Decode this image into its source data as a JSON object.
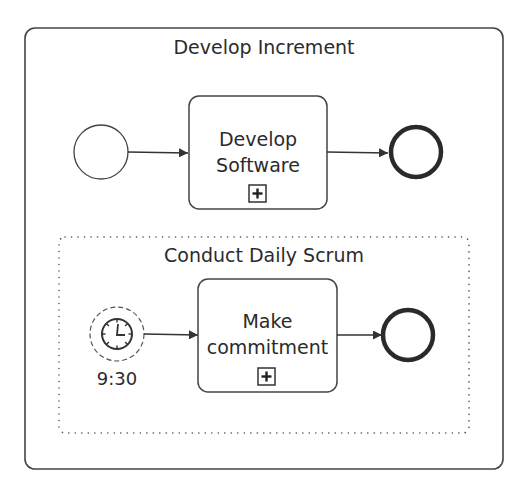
{
  "diagram": {
    "notation": "BPMN",
    "colors": {
      "stroke": "#3a3a3a",
      "text": "#2b2b2b",
      "background": "#ffffff"
    },
    "outer_subprocess": {
      "title": "Develop Increment",
      "start_event": {
        "type": "none-start-event"
      },
      "task": {
        "line1": "Develop",
        "line2": "Software",
        "marker": "collapsed-subprocess-plus"
      },
      "end_event": {
        "type": "none-end-event"
      }
    },
    "event_subprocess": {
      "title": "Conduct Daily Scrum",
      "border": "dotted",
      "start_event": {
        "type": "timer-start-event-non-interrupting",
        "icon": "clock-icon",
        "label": "9:30"
      },
      "task": {
        "line1": "Make",
        "line2": "commitment",
        "marker": "collapsed-subprocess-plus"
      },
      "end_event": {
        "type": "none-end-event"
      }
    },
    "flows": [
      {
        "from": "start",
        "to": "Develop Software"
      },
      {
        "from": "Develop Software",
        "to": "end"
      },
      {
        "from": "9:30 timer",
        "to": "Make commitment"
      },
      {
        "from": "Make commitment",
        "to": "end"
      }
    ]
  }
}
